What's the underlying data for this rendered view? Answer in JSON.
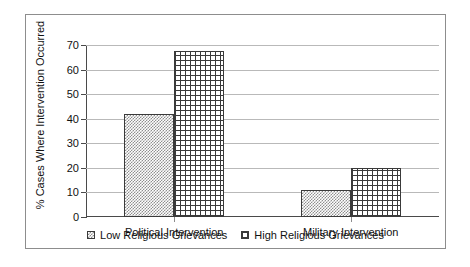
{
  "chart_data": {
    "type": "bar",
    "title": "",
    "xlabel": "",
    "ylabel": "% Cases Where Intervention Occurred",
    "categories": [
      "Political Intervention",
      "Military Intervention"
    ],
    "series": [
      {
        "name": "Low Religious Grievances",
        "values": [
          42,
          11
        ]
      },
      {
        "name": "High Religious Grievances",
        "values": [
          67.5,
          20
        ]
      }
    ],
    "ylim": [
      0,
      70
    ],
    "yticks": [
      0,
      10,
      20,
      30,
      40,
      50,
      60,
      70
    ],
    "ytick_labels": [
      "0",
      "10",
      "20",
      "30",
      "40",
      "50",
      "60",
      "70"
    ],
    "grid": true,
    "legend_position": "bottom",
    "colors": {
      "series_low_fill": "#8f8f8f",
      "series_high_fill": "#3a3a3a",
      "axis": "#4a4a4a",
      "gridline": "#b9b9b9",
      "frame": "#8d8d8d",
      "text": "#111111"
    }
  }
}
